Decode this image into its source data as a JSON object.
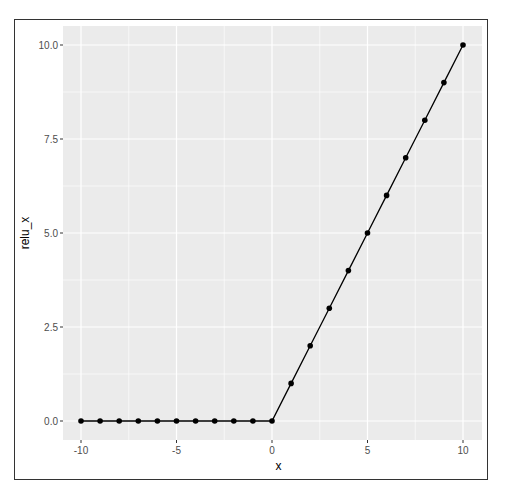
{
  "chart_data": {
    "type": "line",
    "title": "",
    "xlabel": "x",
    "ylabel": "relu_x",
    "x": [
      -10,
      -9,
      -8,
      -7,
      -6,
      -5,
      -4,
      -3,
      -2,
      -1,
      0,
      1,
      2,
      3,
      4,
      5,
      6,
      7,
      8,
      9,
      10
    ],
    "series": [
      {
        "name": "relu_x",
        "values": [
          0,
          0,
          0,
          0,
          0,
          0,
          0,
          0,
          0,
          0,
          0,
          1,
          2,
          3,
          4,
          5,
          6,
          7,
          8,
          9,
          10
        ],
        "markers": true,
        "color": "#000000"
      }
    ],
    "xlim": [
      -11,
      11
    ],
    "ylim": [
      -0.5,
      10.5
    ],
    "xticks": [
      -10,
      -5,
      0,
      5,
      10
    ],
    "xtick_labels": [
      "-10",
      "-5",
      "0",
      "5",
      "10"
    ],
    "yticks": [
      0,
      2.5,
      5,
      7.5,
      10
    ],
    "ytick_labels": [
      "0.0",
      "2.5",
      "5.0",
      "7.5",
      "10.0"
    ],
    "grid": true,
    "legend": "none",
    "panel_background": "#ebebeb",
    "grid_color": "#ffffff"
  }
}
